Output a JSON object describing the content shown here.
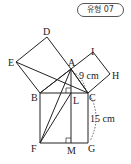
{
  "badge": {
    "label": "유형 07"
  },
  "diagram": {
    "points": {
      "A": "A",
      "B": "B",
      "C": "C",
      "D": "D",
      "E": "E",
      "F": "F",
      "G": "G",
      "H": "H",
      "I": "I",
      "L": "L",
      "M": "M"
    },
    "measures": {
      "AC": "9 cm",
      "CG": "15 cm"
    }
  }
}
